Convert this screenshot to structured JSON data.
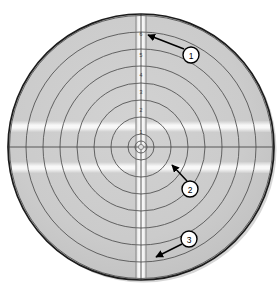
{
  "figure": {
    "type": "annotated-target-disc-diagram",
    "background_color": "#ffffff",
    "disc": {
      "center_x": 141,
      "center_y": 147,
      "radius": 133,
      "fill_color": "#c9c9c9",
      "edge_color": "#1a1a1a",
      "edge_width": 1.6,
      "shadow_color": "#b0b0b0"
    },
    "rings": {
      "count": 8,
      "stroke_color": "#555555",
      "stroke_width": 0.9,
      "radii": [
        13,
        30,
        47,
        64,
        81,
        98,
        115,
        133
      ]
    },
    "axes": {
      "horizontal_line_color": "#555555",
      "vertical_line_color": "#555555",
      "line_width": 0.8
    },
    "center_marker": {
      "radius": 6,
      "inner_radius": 3,
      "stroke_color": "#555555"
    },
    "vertical_strip": {
      "x_left": 136,
      "width": 10,
      "fill_color": "#f4f4f4",
      "edge_color": "#7a7a7a"
    },
    "horizontal_bands": [
      {
        "y": 123,
        "height": 8,
        "fill_color": "#f6f6f6"
      },
      {
        "y": 163,
        "height": 8,
        "fill_color": "#f6f6f6"
      }
    ],
    "tick_labels": [
      {
        "text": "7",
        "x": 141,
        "y": 15
      },
      {
        "text": "6",
        "x": 141,
        "y": 35
      },
      {
        "text": "5",
        "x": 141,
        "y": 56
      },
      {
        "text": "4",
        "x": 141,
        "y": 76
      },
      {
        "text": "3",
        "x": 141,
        "y": 93
      },
      {
        "text": "2",
        "x": 141,
        "y": 111
      },
      {
        "text": "1",
        "x": 141,
        "y": 133
      }
    ],
    "callouts": [
      {
        "id": "1",
        "label": "1",
        "circle_x": 191,
        "circle_y": 55,
        "circle_radius": 8,
        "arrow_tail_x": 184,
        "arrow_tail_y": 49,
        "arrow_tip_x": 146,
        "arrow_tip_y": 35,
        "circle_fill": "#ffffff",
        "circle_stroke": "#000000",
        "arrow_color": "#000000"
      },
      {
        "id": "2",
        "label": "2",
        "circle_x": 190,
        "circle_y": 189,
        "circle_radius": 8,
        "arrow_tail_x": 187,
        "arrow_tail_y": 181,
        "arrow_tip_x": 170,
        "arrow_tip_y": 163,
        "circle_fill": "#ffffff",
        "circle_stroke": "#000000",
        "arrow_color": "#000000"
      },
      {
        "id": "3",
        "label": "3",
        "circle_x": 189,
        "circle_y": 239,
        "circle_radius": 8,
        "arrow_tail_x": 182,
        "arrow_tail_y": 244,
        "arrow_tip_x": 154,
        "arrow_tip_y": 258,
        "circle_fill": "#ffffff",
        "circle_stroke": "#000000",
        "arrow_color": "#000000"
      }
    ]
  }
}
